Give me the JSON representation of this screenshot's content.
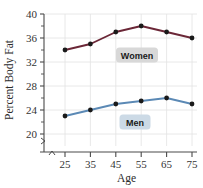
{
  "chart_data": {
    "type": "line",
    "title": "",
    "xlabel": "Age",
    "ylabel": "Percent Body Fat",
    "x": [
      25,
      35,
      45,
      55,
      65,
      75
    ],
    "xticklabels": [
      "25",
      "35",
      "45",
      "55",
      "65",
      "75"
    ],
    "yticks": [
      20,
      24,
      28,
      32,
      36,
      40
    ],
    "yticklabels": [
      "20",
      "24",
      "28",
      "32",
      "36",
      "40"
    ],
    "xlim": [
      20,
      80
    ],
    "ylim": [
      18,
      40
    ],
    "grid": true,
    "legend_position": "inline-annotations",
    "axis_break": true,
    "series": [
      {
        "name": "Women",
        "color": "#6B2737",
        "marker_color": "#1a1a1a",
        "values": [
          34,
          35,
          37,
          38,
          37,
          36
        ],
        "label_bg": "#d8d8d8"
      },
      {
        "name": "Men",
        "color": "#5B89B5",
        "marker_color": "#1a1a1a",
        "values": [
          23,
          24,
          25,
          25.5,
          26,
          25
        ],
        "label_bg": "#ccdae6"
      }
    ]
  }
}
